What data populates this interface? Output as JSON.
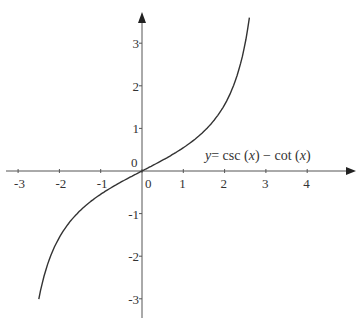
{
  "chart_data": {
    "type": "line",
    "title": "",
    "equation_label": {
      "y": "y",
      "eq": "= csc (",
      "x1": "x",
      "mid": ") − cot (",
      "x2": "x",
      "end": ")"
    },
    "xlabel": "",
    "ylabel": "",
    "xlim": [
      -3.2,
      5.2
    ],
    "ylim": [
      -3.3,
      3.8
    ],
    "x_ticks": [
      -3,
      -2,
      -1,
      0,
      1,
      2,
      3,
      4
    ],
    "y_ticks": [
      -3,
      -2,
      -1,
      1,
      2,
      3
    ],
    "x_tick_labels": [
      "-3",
      "-2",
      "-1",
      "0",
      "1",
      "2",
      "3",
      "4"
    ],
    "y_tick_labels": [
      "-3",
      "-2",
      "-1",
      "1",
      "2",
      "3"
    ],
    "origin_label": "0",
    "grid": false,
    "legend": null,
    "series": [
      {
        "name": "y = csc(x) − cot(x)",
        "function": "tan(x/2)",
        "x": [
          -2.5,
          -2.25,
          -2.0,
          -1.75,
          -1.5,
          -1.25,
          -1.0,
          -0.5,
          0.0,
          0.5,
          1.0,
          1.25,
          1.5,
          1.75,
          2.0,
          2.25,
          2.5,
          2.6
        ],
        "y": [
          -3.01,
          -2.34,
          -1.56,
          -1.22,
          -0.93,
          -0.7,
          -0.55,
          -0.26,
          0.0,
          0.26,
          0.55,
          0.7,
          0.93,
          1.22,
          1.56,
          2.34,
          3.01,
          3.6
        ]
      }
    ]
  },
  "colors": {
    "axis": "#333333",
    "curve": "#333333",
    "background": "#ffffff"
  }
}
